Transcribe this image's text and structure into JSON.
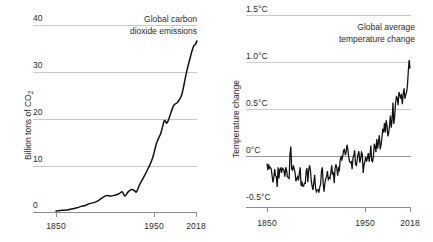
{
  "chart_data": [
    {
      "type": "line",
      "title": "Global carbon dioxide emissions",
      "title_line1": "Global carbon",
      "title_line2": "dioxide emissions",
      "xlabel": "",
      "ylabel": "Billion tons of CO",
      "ylabel_sub": "2",
      "ylim": [
        0,
        40
      ],
      "xlim": [
        1850,
        2018
      ],
      "yticks": [
        "0",
        "10",
        "20",
        "30",
        "40"
      ],
      "ytick_values": [
        0,
        10,
        20,
        30,
        40
      ],
      "xticks": [
        "1850",
        "1950",
        "2018"
      ],
      "xtick_values": [
        1850,
        1950,
        2018
      ],
      "grid": true,
      "legend": "none",
      "series": [
        {
          "name": "Global carbon dioxide emissions",
          "color": "#111111",
          "x": [
            1850,
            1855,
            1860,
            1865,
            1870,
            1875,
            1880,
            1885,
            1890,
            1895,
            1900,
            1905,
            1910,
            1915,
            1920,
            1925,
            1929,
            1932,
            1936,
            1940,
            1944,
            1946,
            1950,
            1955,
            1960,
            1965,
            1970,
            1975,
            1979,
            1982,
            1985,
            1990,
            1995,
            2000,
            2005,
            2010,
            2014,
            2016,
            2018
          ],
          "y": [
            0.2,
            0.3,
            0.4,
            0.5,
            0.7,
            0.9,
            1.2,
            1.4,
            1.8,
            2.0,
            2.4,
            3.0,
            3.5,
            3.4,
            3.6,
            3.9,
            4.3,
            3.4,
            4.3,
            4.8,
            4.5,
            4.3,
            6.0,
            7.6,
            9.4,
            11.5,
            14.8,
            16.9,
            19.5,
            19.0,
            20.2,
            22.7,
            23.5,
            25.2,
            29.5,
            33.1,
            35.5,
            35.8,
            36.6
          ],
          "unit": "billion tons CO2"
        }
      ]
    },
    {
      "type": "line",
      "title": "Global average temperature change",
      "title_line1": "Global average",
      "title_line2": "temperature change",
      "xlabel": "",
      "ylabel": "Temperature change",
      "ylim": [
        -0.5,
        1.5
      ],
      "xlim": [
        1850,
        2018
      ],
      "yticks": [
        "-0.5°C",
        "0°C",
        "0.5°C",
        "1.0°C",
        "1.5°C"
      ],
      "ytick_values": [
        -0.5,
        0,
        0.5,
        1.0,
        1.5
      ],
      "xticks": [
        "1850",
        "1950",
        "2018"
      ],
      "xtick_values": [
        1850,
        1950,
        2018
      ],
      "grid": true,
      "legend": "none",
      "series": [
        {
          "name": "Global average temperature change",
          "color": "#111111",
          "x": [
            1850,
            1851,
            1852,
            1853,
            1854,
            1855,
            1856,
            1857,
            1858,
            1859,
            1860,
            1861,
            1862,
            1863,
            1864,
            1865,
            1866,
            1867,
            1868,
            1869,
            1870,
            1871,
            1872,
            1873,
            1874,
            1875,
            1876,
            1877,
            1878,
            1879,
            1880,
            1881,
            1882,
            1883,
            1884,
            1885,
            1886,
            1887,
            1888,
            1889,
            1890,
            1891,
            1892,
            1893,
            1894,
            1895,
            1896,
            1897,
            1898,
            1899,
            1900,
            1901,
            1902,
            1903,
            1904,
            1905,
            1906,
            1907,
            1908,
            1909,
            1910,
            1911,
            1912,
            1913,
            1914,
            1915,
            1916,
            1917,
            1918,
            1919,
            1920,
            1921,
            1922,
            1923,
            1924,
            1925,
            1926,
            1927,
            1928,
            1929,
            1930,
            1931,
            1932,
            1933,
            1934,
            1935,
            1936,
            1937,
            1938,
            1939,
            1940,
            1941,
            1942,
            1943,
            1944,
            1945,
            1946,
            1947,
            1948,
            1949,
            1950,
            1951,
            1952,
            1953,
            1954,
            1955,
            1956,
            1957,
            1958,
            1959,
            1960,
            1961,
            1962,
            1963,
            1964,
            1965,
            1966,
            1967,
            1968,
            1969,
            1970,
            1971,
            1972,
            1973,
            1974,
            1975,
            1976,
            1977,
            1978,
            1979,
            1980,
            1981,
            1982,
            1983,
            1984,
            1985,
            1986,
            1987,
            1988,
            1989,
            1990,
            1991,
            1992,
            1993,
            1994,
            1995,
            1996,
            1997,
            1998,
            1999,
            2000,
            2001,
            2002,
            2003,
            2004,
            2005,
            2006,
            2007,
            2008,
            2009,
            2010,
            2011,
            2012,
            2013,
            2014,
            2015,
            2016,
            2017,
            2018
          ],
          "y": [
            -0.08,
            -0.15,
            -0.09,
            -0.13,
            -0.12,
            -0.14,
            -0.21,
            -0.28,
            -0.23,
            -0.14,
            -0.21,
            -0.22,
            -0.33,
            -0.12,
            -0.24,
            -0.14,
            -0.13,
            -0.18,
            -0.13,
            -0.14,
            -0.16,
            -0.22,
            -0.12,
            -0.15,
            -0.22,
            -0.23,
            -0.24,
            0.02,
            0.1,
            -0.14,
            -0.15,
            -0.1,
            -0.14,
            -0.18,
            -0.27,
            -0.24,
            -0.22,
            -0.26,
            -0.18,
            -0.12,
            -0.32,
            -0.27,
            -0.32,
            -0.32,
            -0.29,
            -0.29,
            -0.16,
            -0.13,
            -0.28,
            -0.15,
            -0.1,
            -0.15,
            -0.26,
            -0.32,
            -0.36,
            -0.28,
            -0.2,
            -0.34,
            -0.38,
            -0.36,
            -0.36,
            -0.39,
            -0.33,
            -0.3,
            -0.16,
            -0.12,
            -0.29,
            -0.38,
            -0.29,
            -0.24,
            -0.22,
            -0.16,
            -0.25,
            -0.23,
            -0.24,
            -0.18,
            -0.1,
            -0.19,
            -0.18,
            -0.29,
            -0.13,
            -0.09,
            -0.13,
            -0.21,
            -0.13,
            -0.15,
            -0.04,
            -0.01,
            -0.04,
            0.0,
            0.06,
            0.07,
            0.01,
            0.04,
            0.12,
            0.07,
            -0.01,
            -0.06,
            -0.07,
            -0.06,
            -0.14,
            -0.02,
            0.01,
            0.06,
            -0.09,
            -0.1,
            -0.04,
            0.02,
            0.05,
            -0.07,
            -0.03,
            0.04,
            0.02,
            -0.18,
            -0.09,
            -0.06,
            -0.01,
            -0.06,
            -0.02,
            0.03,
            -0.06,
            0.01,
            0.11,
            -0.05,
            -0.06,
            -0.01,
            0.13,
            0.1,
            0.04,
            0.18,
            0.08,
            0.15,
            0.22,
            0.07,
            0.12,
            0.19,
            0.29,
            0.25,
            0.35,
            0.25,
            0.38,
            0.32,
            0.21,
            0.25,
            0.33,
            0.43,
            0.3,
            0.39,
            0.57,
            0.34,
            0.42,
            0.56,
            0.63,
            0.62,
            0.54,
            0.68,
            0.65,
            0.61,
            0.66,
            0.55,
            0.66,
            0.72,
            0.61,
            0.65,
            0.68,
            0.75,
            0.9,
            1.02,
            0.93,
            0.85
          ],
          "unit": "degrees Celsius"
        }
      ]
    }
  ]
}
